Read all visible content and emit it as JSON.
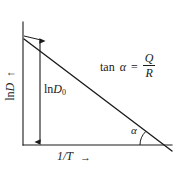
{
  "figure": {
    "type": "line-plot-schematic",
    "background_color": "#ffffff",
    "stroke_color": "#1a1a1a",
    "text_color": "#1a1a1a"
  },
  "axes": {
    "y": {
      "label": "ln D",
      "label_prefix": "ln",
      "label_symbol": "D",
      "direction_arrow": "↑",
      "origin_px": {
        "x": 23,
        "y": 145
      },
      "top_px": {
        "x": 23,
        "y": 22
      }
    },
    "x": {
      "label": "1/T",
      "direction_arrow": "→",
      "origin_px": {
        "x": 23,
        "y": 145
      },
      "right_px": {
        "x": 172,
        "y": 145
      }
    }
  },
  "data_line": {
    "name": "arrhenius-line",
    "start_px": {
      "x": 24,
      "y": 39
    },
    "end_px": {
      "x": 172,
      "y": 151
    },
    "slope_sign": "negative"
  },
  "annotations": {
    "intercept_marker": {
      "name": "ln-D0-double-arrow",
      "label_prefix": "ln",
      "label_symbol": "D",
      "label_subscript": "0",
      "label_full": "ln D0",
      "x_px": 40,
      "top_y_px": 38,
      "bottom_y_px": 145
    },
    "slope_equation": {
      "function": "tan",
      "angle_symbol": "α",
      "equals": "=",
      "numerator": "Q",
      "denominator": "R",
      "full": "tan α = Q/R"
    },
    "angle": {
      "symbol": "α",
      "vertex_px": {
        "x": 158,
        "y": 145
      },
      "arc_radius_px": 22
    }
  }
}
